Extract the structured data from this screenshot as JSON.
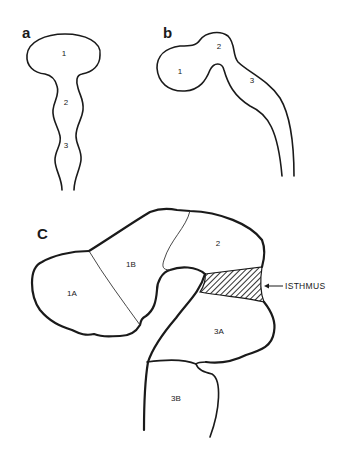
{
  "panels": {
    "a": {
      "label": "a",
      "regions": [
        "1",
        "2",
        "3"
      ]
    },
    "b": {
      "label": "b",
      "regions": [
        "1",
        "2",
        "3"
      ]
    },
    "c": {
      "label": "C",
      "regions": [
        "1A",
        "1B",
        "2",
        "3A",
        "3B"
      ],
      "callout": "ISTHMUS"
    }
  },
  "colors": {
    "line": "#1a1a1a",
    "background": "#ffffff"
  }
}
